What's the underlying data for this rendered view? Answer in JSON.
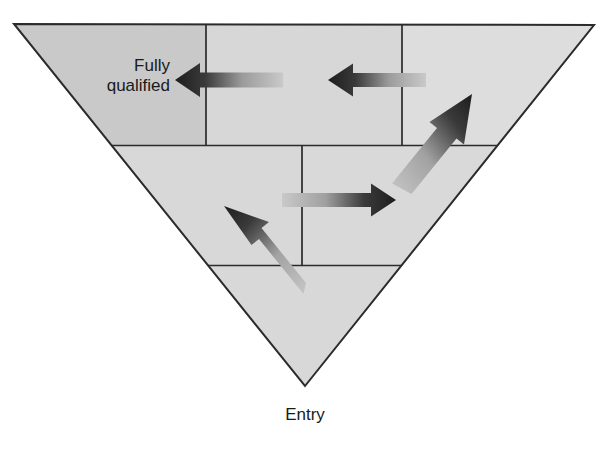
{
  "figure": {
    "type": "inverted-triangle-progression-diagram",
    "background_color": "#ffffff",
    "outline_color": "#2b2b2b",
    "labels": {
      "top_left_line1": "Fully",
      "top_left_line2": "qualified",
      "bottom": "Entry"
    },
    "triangle": {
      "apex_bottom": [
        305,
        386
      ],
      "top_left": [
        14,
        24
      ],
      "top_right": [
        594,
        25
      ],
      "fill_base": "#d8d8d8"
    },
    "bands": [
      {
        "name": "top-band",
        "y_top": 24,
        "y_bottom": 145,
        "cells": [
          {
            "name": "cell-top-left",
            "fill": "#c9c9c9",
            "x_start": 14,
            "x_end": 206
          },
          {
            "name": "cell-top-middle",
            "fill": "#d7d7d7",
            "x_start": 206,
            "x_end": 402
          },
          {
            "name": "cell-top-right",
            "fill": "#dddddd",
            "x_start": 402,
            "x_end": 594
          }
        ],
        "vertical_dividers_x": [
          206,
          402
        ]
      },
      {
        "name": "middle-band",
        "y_top": 145,
        "y_bottom": 265,
        "cells": [
          {
            "name": "cell-middle-left",
            "fill": "#d8d8d8",
            "x_start": 135,
            "x_end": 302
          },
          {
            "name": "cell-middle-right",
            "fill": "#d9d9d9",
            "x_start": 302,
            "x_end": 474
          }
        ],
        "vertical_dividers_x": [
          302
        ]
      },
      {
        "name": "bottom-band",
        "y_top": 265,
        "y_bottom": 386,
        "cells": [
          {
            "name": "cell-bottom",
            "fill": "#d8d8d8",
            "x_start": 195,
            "x_end": 414
          }
        ],
        "vertical_dividers_x": []
      }
    ],
    "arrows": [
      {
        "name": "arrow-top-left-inward",
        "direction": "left",
        "from": [
          283,
          80
        ],
        "to": [
          175,
          80
        ],
        "head_color": "#1d1d1d",
        "tail_color": "#c4c4c4"
      },
      {
        "name": "arrow-top-middle-inward",
        "direction": "left",
        "from": [
          426,
          80
        ],
        "to": [
          328,
          80
        ],
        "head_color": "#1d1d1d",
        "tail_color": "#c9c9c9"
      },
      {
        "name": "arrow-diagonal-up-right",
        "direction": "up-right",
        "from": [
          396,
          188
        ],
        "to": [
          472,
          94
        ],
        "head_color": "#1d1d1d",
        "tail_color": "#c6c6c6"
      },
      {
        "name": "arrow-middle-right",
        "direction": "right",
        "from": [
          282,
          200
        ],
        "to": [
          396,
          200
        ],
        "head_color": "#1d1d1d",
        "tail_color": "#c9c9c9"
      },
      {
        "name": "arrow-diagonal-up-left",
        "direction": "up-left",
        "from": [
          299,
          299
        ],
        "to": [
          224,
          206
        ],
        "head_color": "#1d1d1d",
        "tail_color": "#c6c6c6"
      }
    ]
  }
}
